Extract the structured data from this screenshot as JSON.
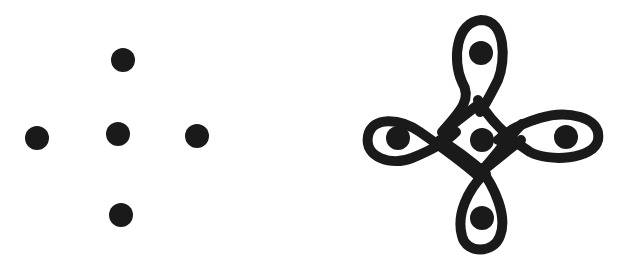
{
  "figure": {
    "background": "#ffffff",
    "ink": "#1a1a1a",
    "panels": [
      {
        "id": "dot-grid",
        "description": "Five-dot cross arrangement (kolam dot grid)",
        "dots": [
          {
            "name": "top",
            "cx": 123,
            "cy": 60,
            "r": 12
          },
          {
            "name": "left",
            "cx": 37,
            "cy": 138,
            "r": 12
          },
          {
            "name": "center",
            "cx": 118,
            "cy": 134,
            "r": 12
          },
          {
            "name": "right",
            "cx": 197,
            "cy": 136,
            "r": 12
          },
          {
            "name": "bottom",
            "cx": 121,
            "cy": 215,
            "r": 12
          }
        ]
      },
      {
        "id": "kolam-pattern",
        "description": "Kolam loop pattern drawn around the five dots",
        "dots": [
          {
            "name": "top",
            "cx": 481,
            "cy": 53,
            "r": 12
          },
          {
            "name": "left",
            "cx": 398,
            "cy": 138,
            "r": 12
          },
          {
            "name": "center",
            "cx": 482,
            "cy": 140,
            "r": 12
          },
          {
            "name": "right",
            "cx": 566,
            "cy": 137,
            "r": 12
          },
          {
            "name": "bottom",
            "cx": 482,
            "cy": 218,
            "r": 12
          }
        ],
        "stroke_width": 10
      }
    ]
  }
}
